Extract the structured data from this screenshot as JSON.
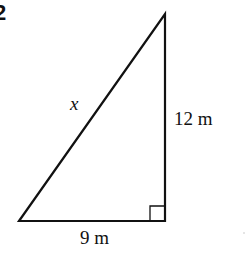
{
  "problem": {
    "number": "2"
  },
  "triangle": {
    "type": "right-triangle",
    "vertices": {
      "bottom_left": [
        19,
        221
      ],
      "right_angle": [
        165,
        221
      ],
      "top": [
        165,
        14
      ]
    },
    "right_angle_marker_size": 15,
    "stroke_color": "#111111",
    "stroke_width": 2.2
  },
  "labels": {
    "hypotenuse": "x",
    "vertical_side": "12 m",
    "base": "9 m"
  },
  "colors": {
    "background": "#ffffff",
    "ink": "#111111"
  }
}
